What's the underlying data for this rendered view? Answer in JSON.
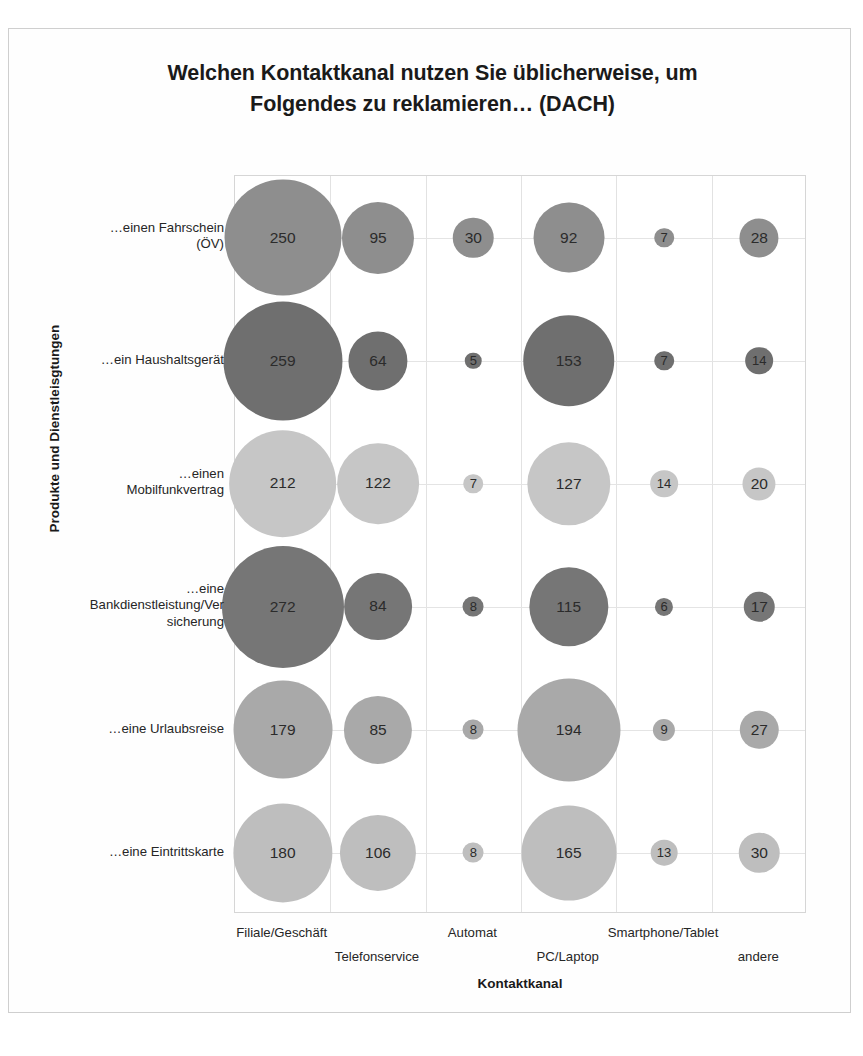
{
  "chart_title": "Welchen Kontaktkanal nutzen Sie üblicherweise, um\nFolgendes zu reklamieren… (DACH)",
  "axis": {
    "y_title": "Produkte und Dienstleisgtungen",
    "x_title": "Kontaktkanal"
  },
  "chart_data": {
    "type": "bar",
    "render_as": "bubble-matrix",
    "title": "Welchen Kontaktkanal nutzen Sie üblicherweise, um Folgendes zu reklamieren… (DACH)",
    "xlabel": "Kontaktkanal",
    "ylabel": "Produkte und Dienstleisgtungen",
    "grid": true,
    "legend": "none",
    "categories": [
      "Filiale/Geschäft",
      "Telefonservice",
      "Automat",
      "PC/Laptop",
      "Smartphone/Tablet",
      "andere"
    ],
    "rows": [
      "…einen Fahrschein\n(ÖV)",
      "…ein Haushaltsgerät",
      "…einen\nMobilfunkvertrag",
      "…eine\nBankdienstleistung/Ver\nsicherung",
      "…eine Urlaubsreise",
      "…eine Eintrittskarte"
    ],
    "series": [
      {
        "name": "…einen Fahrschein (ÖV)",
        "values": [
          250,
          95,
          30,
          92,
          7,
          28
        ],
        "color": "#8e8e8e"
      },
      {
        "name": "…ein Haushaltsgerät",
        "values": [
          259,
          64,
          5,
          153,
          7,
          14
        ],
        "color": "#6f6f6f"
      },
      {
        "name": "…einen Mobilfunkvertrag",
        "values": [
          212,
          122,
          7,
          127,
          14,
          20
        ],
        "color": "#c6c6c6"
      },
      {
        "name": "…eine Bankdienstleistung/Versicherung",
        "values": [
          272,
          84,
          8,
          115,
          6,
          17
        ],
        "color": "#767676"
      },
      {
        "name": "…eine Urlaubsreise",
        "values": [
          179,
          85,
          8,
          194,
          9,
          27
        ],
        "color": "#a9a9a9"
      },
      {
        "name": "…eine Eintrittskarte",
        "values": [
          180,
          106,
          8,
          165,
          13,
          30
        ],
        "color": "#bebebe"
      }
    ]
  },
  "colors": {
    "plot_border": "#d6d6d6",
    "gridline": "#e2e2e2",
    "text": "#262626",
    "page_border": "#cfcfcf"
  }
}
